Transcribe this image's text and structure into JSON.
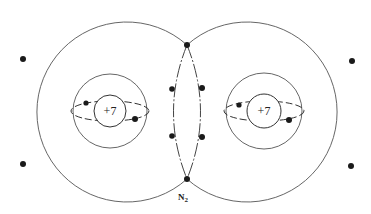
{
  "diagram": {
    "type": "bohr-model-molecule",
    "molecule_label": "N",
    "molecule_subscript": "2",
    "atoms": [
      {
        "name": "left-nitrogen",
        "nucleus_charge": "+7",
        "center": [
          110,
          111
        ],
        "outer_shell": {
          "cx": 97,
          "cy": 112,
          "r": 90
        },
        "inner_shell_r": 37,
        "nucleus_r": 16,
        "inner_electrons": [
          [
            86,
            103
          ],
          [
            135,
            119
          ]
        ],
        "outer_electrons": [
          [
            23,
            59
          ],
          [
            23,
            164
          ]
        ]
      },
      {
        "name": "right-nitrogen",
        "nucleus_charge": "+7",
        "center": [
          264,
          111
        ],
        "outer_shell": {
          "cx": 277,
          "cy": 112,
          "r": 90
        },
        "inner_shell_r": 38,
        "nucleus_r": 17,
        "inner_electrons": [
          [
            239,
            105
          ],
          [
            289,
            120
          ]
        ],
        "outer_electrons": [
          [
            352,
            61
          ],
          [
            351,
            166
          ]
        ]
      }
    ],
    "shared_electrons": [
      [
        187,
        45
      ],
      [
        171,
        89
      ],
      [
        202,
        88
      ],
      [
        171,
        136
      ],
      [
        202,
        137
      ],
      [
        187,
        179
      ]
    ],
    "colors": {
      "line": "#555555",
      "electron": "#1a1a1a",
      "background": "#ffffff"
    }
  }
}
